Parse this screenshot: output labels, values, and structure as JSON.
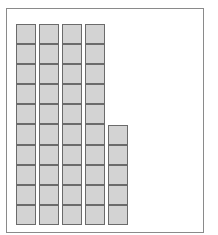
{
  "diagram": {
    "type": "base-ten-blocks",
    "cell_color": "#d3d3d3",
    "border_color": "#6b6b6b",
    "frame_color": "#8a8a8a",
    "rods": [
      {
        "cells": 10
      },
      {
        "cells": 10
      },
      {
        "cells": 10
      },
      {
        "cells": 10
      },
      {
        "cells": 5
      }
    ],
    "tens": 4,
    "ones": 5,
    "total": 45
  }
}
